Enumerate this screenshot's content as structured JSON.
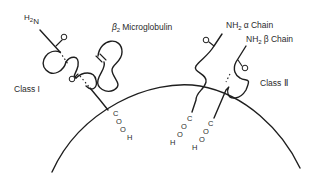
{
  "diagram": {
    "labels": {
      "class1_nterm": "H",
      "class1_nterm_sub": "2",
      "class1_nterm_n": "N",
      "beta2_prefix": "β",
      "beta2_sub": "2",
      "beta2_rest": "Microglobulin",
      "class1_label": "Class I",
      "class2_label": "Class Ⅱ",
      "alpha_chain_nh": "NH",
      "alpha_chain_sub": "2",
      "alpha_chain_rest": "α Chain",
      "beta_chain_nh": "NH",
      "beta_chain_sub": "2",
      "beta_chain_rest": "β Chain",
      "cooh_c": "C",
      "cooh_o1": "O",
      "cooh_o2": "O",
      "cooh_h": "H"
    },
    "colors": {
      "line": "#1e1e1e",
      "text": "#2a2a2a",
      "background": "#ffffff"
    }
  }
}
